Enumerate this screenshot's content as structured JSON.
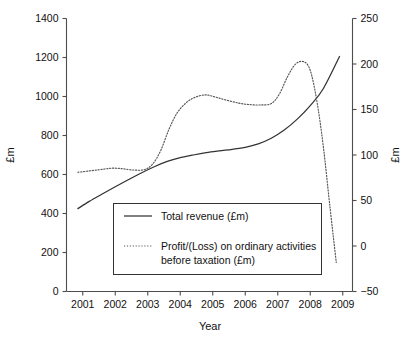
{
  "chart_data": {
    "type": "line",
    "title": "",
    "xlabel": "Year",
    "ylabel": "£m",
    "ylabel_right": "£m",
    "xlim": [
      2000.5,
      2009.3
    ],
    "ylim": [
      0,
      1400
    ],
    "ylim_right": [
      -50,
      250
    ],
    "grid": false,
    "legend_position": "inside-lower-center",
    "x_tick_labels": [
      "2001",
      "2002",
      "2003",
      "2004",
      "2005",
      "2006",
      "2007",
      "2008",
      "2009"
    ],
    "x_ticks": [
      2001,
      2002,
      2003,
      2004,
      2005,
      2006,
      2007,
      2008,
      2009
    ],
    "y_tick_labels_left": [
      "0",
      "200",
      "400",
      "600",
      "800",
      "1000",
      "1200",
      "1400"
    ],
    "y_ticks_left": [
      0,
      200,
      400,
      600,
      800,
      1000,
      1200,
      1400
    ],
    "y_tick_labels_right": [
      "−50",
      "0",
      "50",
      "100",
      "150",
      "200",
      "250"
    ],
    "y_ticks_right": [
      -50,
      0,
      50,
      100,
      150,
      200,
      250
    ],
    "series": [
      {
        "name": "Total revenue (£m)",
        "axis": "left",
        "style": "solid",
        "x": [
          2000.85,
          2001.2,
          2001.6,
          2002.0,
          2002.4,
          2002.8,
          2003.2,
          2003.6,
          2004.0,
          2004.4,
          2004.8,
          2005.2,
          2005.6,
          2006.0,
          2006.4,
          2006.8,
          2007.2,
          2007.6,
          2008.0,
          2008.4,
          2008.9
        ],
        "values": [
          425,
          462,
          500,
          537,
          573,
          608,
          640,
          667,
          686,
          700,
          712,
          721,
          729,
          739,
          757,
          786,
          828,
          884,
          953,
          1040,
          1205
        ]
      },
      {
        "name": "Profit/(Loss) on ordinary activities before taxation (£m)",
        "axis": "right",
        "style": "dotted",
        "x": [
          2000.85,
          2001.2,
          2001.55,
          2001.9,
          2002.2,
          2002.55,
          2002.9,
          2003.15,
          2003.4,
          2003.65,
          2003.9,
          2004.2,
          2004.5,
          2004.8,
          2005.1,
          2005.45,
          2005.8,
          2006.1,
          2006.45,
          2006.8,
          2007.05,
          2007.3,
          2007.55,
          2007.8,
          2008.0,
          2008.2,
          2008.4,
          2008.6,
          2008.8
        ],
        "values": [
          81,
          82.5,
          84,
          85.5,
          85,
          83.5,
          84,
          90,
          105,
          128,
          146,
          158,
          164,
          166,
          163.5,
          160,
          157,
          155.5,
          155,
          156.5,
          167,
          186,
          200,
          202.5,
          193,
          160,
          110,
          45,
          -18
        ]
      }
    ]
  },
  "legend": {
    "entries": [
      {
        "label": "Total revenue (£m)",
        "style": "solid"
      },
      {
        "label_line1": "Profit/(Loss) on ordinary activities",
        "label_line2": "before taxation (£m)",
        "style": "dotted"
      }
    ]
  },
  "colors": {
    "axis": "#4d4d4d",
    "solid_series": "#333333",
    "dotted_series": "#555555",
    "background": "#ffffff",
    "text": "#111111"
  }
}
